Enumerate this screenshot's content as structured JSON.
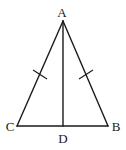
{
  "diagram": {
    "type": "geometry",
    "points": {
      "A": {
        "label": "A",
        "x": 63,
        "y": 21
      },
      "B": {
        "label": "B",
        "x": 108,
        "y": 126
      },
      "C": {
        "label": "C",
        "x": 17,
        "y": 126
      },
      "D": {
        "label": "D",
        "x": 63,
        "y": 126
      }
    },
    "segments": [
      "AB",
      "AC",
      "CB",
      "AD"
    ],
    "equal_marks": [
      "AC",
      "AB"
    ],
    "stroke_color": "#1a1a1a",
    "background": "#ffffff"
  }
}
